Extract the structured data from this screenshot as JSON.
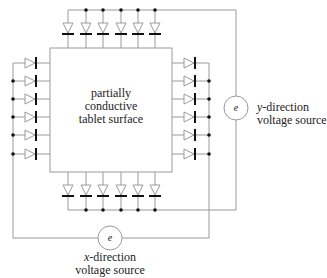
{
  "diagram": {
    "tablet": {
      "label_lines": [
        "partially",
        "conductive",
        "tablet surface"
      ]
    },
    "y_source": {
      "symbol": "e",
      "label_prefix": "y",
      "label_line1_rest": "-direction",
      "label_line2": "voltage source"
    },
    "x_source": {
      "symbol": "e",
      "label_prefix": "x",
      "label_line1_rest": "-direction",
      "label_line2": "voltage source"
    },
    "diode_counts": {
      "top": 6,
      "bottom": 6,
      "left": 6,
      "right": 6
    },
    "colors": {
      "line": "#9a9a9a",
      "diode_bar": "#111111",
      "dot": "#111111",
      "text": "#222222"
    }
  }
}
